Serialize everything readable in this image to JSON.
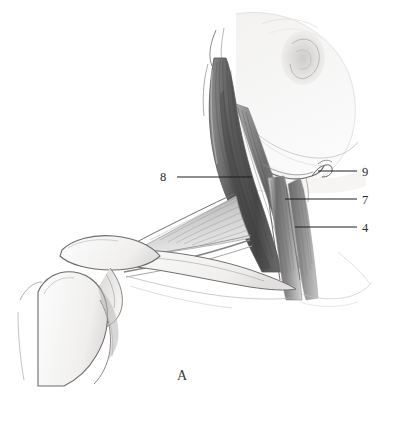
{
  "figure": {
    "caption": "A",
    "medium": "pencil-anatomical-drawing",
    "background_color": "#ffffff",
    "ink_color": "#2b2b2b"
  },
  "labels": [
    {
      "id": "label-8",
      "text": "8",
      "structure": "sternocleidomastoid",
      "text_x": 163,
      "text_y": 181,
      "line_x1": 177,
      "line_y1": 177,
      "line_x2": 252,
      "line_y2": 177,
      "side": "left"
    },
    {
      "id": "label-9",
      "text": "9",
      "structure": "hyoid bone",
      "text_x": 363,
      "text_y": 176,
      "line_x1": 318,
      "line_y1": 171,
      "line_x2": 357,
      "line_y2": 171,
      "side": "right"
    },
    {
      "id": "label-7",
      "text": "7",
      "structure": "omohyoid muscle",
      "text_x": 363,
      "text_y": 204,
      "line_x1": 285,
      "line_y1": 199,
      "line_x2": 357,
      "line_y2": 199,
      "side": "right"
    },
    {
      "id": "label-4",
      "text": "4",
      "structure": "scalene muscle group",
      "text_x": 363,
      "text_y": 232,
      "line_x1": 295,
      "line_y1": 227,
      "line_x2": 357,
      "line_y2": 227,
      "side": "right"
    }
  ],
  "caption_position": {
    "x": 182,
    "y": 380
  },
  "palette": {
    "muscle_dark": "#4a4a4a",
    "muscle_mid": "#7a7a7a",
    "muscle_light": "#b4b4b4",
    "bone_outline": "#6d6d6d",
    "skin_wash": "#e8e6e4",
    "label_ink": "#2b2b2b"
  }
}
